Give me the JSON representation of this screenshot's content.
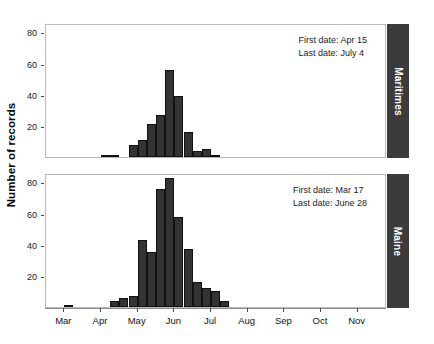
{
  "figure": {
    "ylabel": "Number of records",
    "background": "#ffffff",
    "bar_color": "#333333",
    "strip_color": "#3b3b3b",
    "strip_text_color": "#ffffff"
  },
  "xaxis": {
    "ticks": [
      "Mar",
      "Apr",
      "May",
      "Jun",
      "Jul",
      "Aug",
      "Sep",
      "Oct",
      "Nov"
    ],
    "tick_positions": [
      0.5,
      1.5,
      2.5,
      3.5,
      4.5,
      5.5,
      6.5,
      7.5,
      8.5
    ],
    "range_months": [
      0,
      9.3
    ]
  },
  "panels": [
    {
      "id": "maritimes",
      "strip_label": "Maritimes",
      "annotations": {
        "first_date": "First date: Apr 15",
        "last_date": "Last date: July 4"
      },
      "yticks": [
        20,
        40,
        60,
        80
      ],
      "ylim": [
        0,
        86
      ]
    },
    {
      "id": "maine",
      "strip_label": "Maine",
      "annotations": {
        "first_date": "First date: Mar 17",
        "last_date": "Last date: June 28"
      },
      "yticks": [
        20,
        40,
        60,
        80
      ],
      "ylim": [
        0,
        86
      ]
    }
  ],
  "chart_data": [
    {
      "type": "bar",
      "title": "Maritimes",
      "xlabel": "",
      "ylabel": "Number of records",
      "ylim": [
        0,
        86
      ],
      "grid": false,
      "legend": false,
      "annotations": [
        "First date: Apr 15",
        "Last date: July 4"
      ],
      "bin_width_months": 0.25,
      "categories": [
        "Mar 1",
        "Mar 8",
        "Mar 15",
        "Mar 23",
        "Mar 30",
        "Apr 7",
        "Apr 14",
        "Apr 22",
        "Apr 29",
        "May 7",
        "May 14",
        "May 22",
        "May 29",
        "Jun 6",
        "Jun 13",
        "Jun 21",
        "Jun 28",
        "Jul 6",
        "Jul 13",
        "Jul 21",
        "Jul 28",
        "Aug 5",
        "Aug 12",
        "Aug 20",
        "Aug 27",
        "Sep 4",
        "Sep 11",
        "Sep 19",
        "Sep 26",
        "Oct 4",
        "Oct 11",
        "Oct 19",
        "Oct 26",
        "Nov 3",
        "Nov 10"
      ],
      "x_month_offsets": [
        0.0,
        0.25,
        0.5,
        0.75,
        1.0,
        1.25,
        1.5,
        1.75,
        2.0,
        2.25,
        2.5,
        2.75,
        3.0,
        3.25,
        3.5,
        3.75,
        4.0,
        4.25,
        4.5,
        4.75,
        5.0,
        5.25,
        5.5,
        5.75,
        6.0,
        6.25,
        6.5,
        6.75,
        7.0,
        7.25,
        7.5,
        7.75,
        8.0,
        8.25,
        8.5
      ],
      "values": [
        0,
        0,
        0,
        0,
        0,
        0,
        1,
        1,
        0,
        8,
        11,
        21,
        27,
        56,
        39,
        16,
        4,
        5,
        1,
        0,
        0,
        0,
        0,
        0,
        0,
        0,
        0,
        0,
        0,
        0,
        0,
        0,
        0,
        0,
        0
      ]
    },
    {
      "type": "bar",
      "title": "Maine",
      "xlabel": "",
      "ylabel": "Number of records",
      "ylim": [
        0,
        86
      ],
      "grid": false,
      "legend": false,
      "annotations": [
        "First date: Mar 17",
        "Last date: June 28"
      ],
      "bin_width_months": 0.25,
      "categories": [
        "Mar 1",
        "Mar 8",
        "Mar 15",
        "Mar 23",
        "Mar 30",
        "Apr 7",
        "Apr 14",
        "Apr 22",
        "Apr 29",
        "May 7",
        "May 14",
        "May 22",
        "May 29",
        "Jun 6",
        "Jun 13",
        "Jun 21",
        "Jun 28",
        "Jul 6",
        "Jul 13",
        "Jul 21",
        "Jul 28",
        "Aug 5",
        "Aug 12",
        "Aug 20",
        "Aug 27",
        "Sep 4",
        "Sep 11",
        "Sep 19",
        "Sep 26",
        "Oct 4",
        "Oct 11",
        "Oct 19",
        "Oct 26",
        "Nov 3",
        "Nov 10"
      ],
      "x_month_offsets": [
        0.0,
        0.25,
        0.5,
        0.75,
        1.0,
        1.25,
        1.5,
        1.75,
        2.0,
        2.25,
        2.5,
        2.75,
        3.0,
        3.25,
        3.5,
        3.75,
        4.0,
        4.25,
        4.5,
        4.75,
        5.0,
        5.25,
        5.5,
        5.75,
        6.0,
        6.25,
        6.5,
        6.75,
        7.0,
        7.25,
        7.5,
        7.75,
        8.0,
        8.25,
        8.5
      ],
      "values": [
        0,
        0,
        1,
        0,
        0,
        0,
        0,
        4,
        6,
        7,
        43,
        35,
        76,
        83,
        58,
        37,
        16,
        12,
        10,
        4,
        0,
        0,
        0,
        0,
        0,
        0,
        0,
        0,
        0,
        0,
        0,
        0,
        0,
        0,
        0
      ]
    }
  ]
}
